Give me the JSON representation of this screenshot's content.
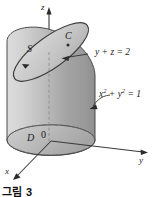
{
  "figure": {
    "caption": "그림 3",
    "axes": {
      "z_label": "z",
      "y_label": "y",
      "x_label": "x"
    },
    "labels": {
      "surface": "S",
      "curve": "C",
      "disk": "D",
      "origin": "0"
    },
    "equations": {
      "plane": "y + z = 2",
      "cylinder_base": "x",
      "cylinder_base_exp1": "2",
      "cylinder_base_mid": " + y",
      "cylinder_base_exp2": "2",
      "cylinder_base_end": " = 1"
    },
    "colors": {
      "stroke": "#3a3a3a",
      "fill_light": "#d9d9d9",
      "fill_mid": "#b8b8b8",
      "fill_dark": "#9a9a9a",
      "top_fill": "#c9c9c9",
      "background": "#ffffff"
    }
  }
}
